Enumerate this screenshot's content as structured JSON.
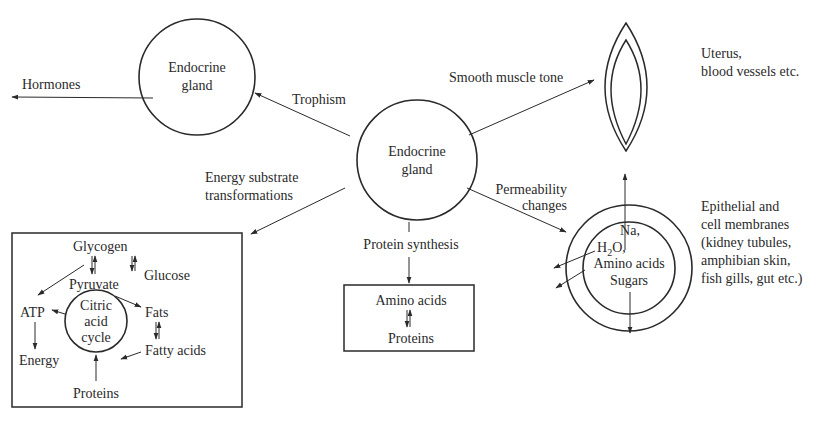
{
  "diagram": {
    "central_gland": {
      "line1": "Endocrine",
      "line2": "gland"
    },
    "target_gland": {
      "line1": "Endocrine",
      "line2": "gland"
    },
    "edges": {
      "hormones": "Hormones",
      "trophism": "Trophism",
      "smooth_muscle": "Smooth muscle tone",
      "energy_line1": "Energy substrate",
      "energy_line2": "transformations",
      "protein_synthesis": "Protein synthesis",
      "permeability_line1": "Permeability",
      "permeability_line2": "changes"
    },
    "smooth_muscle_target": {
      "line1": "Uterus,",
      "line2": "blood vessels etc."
    },
    "metabolism_box": {
      "glycogen": "Glycogen",
      "glucose": "Glucose",
      "pyruvate": "Pyruvate",
      "atp": "ATP",
      "energy": "Energy",
      "fats": "Fats",
      "fatty_acids": "Fatty acids",
      "proteins": "Proteins",
      "cycle_line1": "Citric",
      "cycle_line2": "acid",
      "cycle_line3": "cycle"
    },
    "protein_box": {
      "amino_acids": "Amino acids",
      "proteins": "Proteins"
    },
    "membrane": {
      "na": "Na,",
      "h2o_h": "H",
      "h2o_sub": "2",
      "h2o_rest": "O,",
      "amino_acids": "Amino acids",
      "sugars": "Sugars"
    },
    "membrane_target": {
      "line1": "Epithelial and",
      "line2": "cell membranes",
      "line3": "(kidney tubules,",
      "line4": "amphibian skin,",
      "line5": "fish gills, gut etc.)"
    }
  },
  "colors": {
    "ink": "#2a2a2a",
    "background": "#ffffff"
  }
}
